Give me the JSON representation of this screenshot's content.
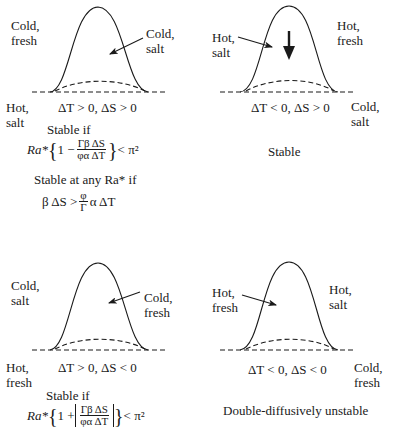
{
  "panels": [
    {
      "id": "top-left",
      "labels": {
        "upper_left": [
          "Cold,",
          "fresh"
        ],
        "inner": [
          "Cold,",
          "salt"
        ],
        "lower_left": [
          "Hot,",
          "salt"
        ]
      },
      "condition": "ΔT > 0, ΔS > 0",
      "stability": {
        "line1": "Stable if",
        "eq1_prefix": "Ra*",
        "eq1_one": "1 −",
        "eq1_num": "Γβ ΔS",
        "eq1_den": "φα ΔT",
        "eq1_suffix": "< π²",
        "line2": "Stable at any Ra* if",
        "eq2_left": "β ΔS >",
        "eq2_num": "φ",
        "eq2_den": "Γ",
        "eq2_right": "α ΔT"
      }
    },
    {
      "id": "top-right",
      "labels": {
        "inner": [
          "Hot,",
          "salt"
        ],
        "upper_right": [
          "Hot,",
          "fresh"
        ],
        "lower_right": [
          "Cold,",
          "salt"
        ]
      },
      "condition": "ΔT < 0, ΔS > 0",
      "stability": {
        "line1": "Stable"
      }
    },
    {
      "id": "bottom-left",
      "labels": {
        "upper_left": [
          "Cold,",
          "salt"
        ],
        "inner": [
          "Cold,",
          "fresh"
        ],
        "lower_left": [
          "Hot,",
          "fresh"
        ]
      },
      "condition": "ΔT > 0, ΔS < 0",
      "stability": {
        "line1": "Stable if",
        "eq1_prefix": "Ra*",
        "eq1_one": "1 +",
        "eq1_num": "Γβ ΔS",
        "eq1_den": "φα ΔT",
        "eq1_suffix": "< π²"
      }
    },
    {
      "id": "bottom-right",
      "labels": {
        "inner": [
          "Hot,",
          "fresh"
        ],
        "upper_right": [
          "Hot,",
          "salt"
        ],
        "lower_right": [
          "Cold,",
          "fresh"
        ]
      },
      "condition": "ΔT < 0, ΔS < 0",
      "stability": {
        "line1": "Double-diffusively unstable"
      }
    }
  ],
  "colors": {
    "ink": "#1a1a1a",
    "background": "#ffffff"
  }
}
